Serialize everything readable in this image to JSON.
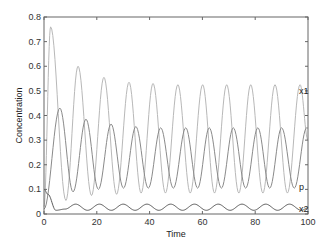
{
  "chart_data": {
    "type": "line",
    "title": "",
    "xlabel": "Time",
    "ylabel": "Concentration",
    "xlim": [
      0,
      100
    ],
    "ylim": [
      0,
      0.8
    ],
    "xticks": [
      0,
      20,
      40,
      60,
      80,
      100
    ],
    "yticks": [
      0,
      0.1,
      0.2,
      0.3,
      0.4,
      0.5,
      0.6,
      0.7,
      0.8
    ],
    "ytick_labels": [
      "0",
      "0.1",
      "0.2",
      "0.3",
      "0.4",
      "0.5",
      "0.6",
      "0.7",
      "0.8"
    ],
    "grid": false,
    "legend": "inline labels at right end of each series",
    "series": [
      {
        "name": "x1",
        "color": "#b8b8b8",
        "label_value": 0.5,
        "keypoints": [
          [
            0,
            0.03
          ],
          [
            2.5,
            0.76
          ],
          [
            8.3,
            0.055
          ],
          [
            12.9,
            0.6
          ],
          [
            18.0,
            0.075
          ],
          [
            22.7,
            0.555
          ],
          [
            27.5,
            0.08
          ],
          [
            32.2,
            0.535
          ],
          [
            36.8,
            0.085
          ],
          [
            41.3,
            0.53
          ],
          [
            46.0,
            0.085
          ],
          [
            50.7,
            0.525
          ],
          [
            55.4,
            0.085
          ],
          [
            60.1,
            0.525
          ],
          [
            64.6,
            0.085
          ],
          [
            69.2,
            0.525
          ],
          [
            73.8,
            0.085
          ],
          [
            78.3,
            0.525
          ],
          [
            82.9,
            0.085
          ],
          [
            87.5,
            0.525
          ],
          [
            92.2,
            0.085
          ],
          [
            97.0,
            0.525
          ],
          [
            100,
            0.3
          ]
        ]
      },
      {
        "name": "p",
        "color": "#8a8a8a",
        "label_value": 0.11,
        "keypoints": [
          [
            0,
            0.02
          ],
          [
            6.0,
            0.43
          ],
          [
            11.0,
            0.09
          ],
          [
            15.9,
            0.385
          ],
          [
            20.6,
            0.1
          ],
          [
            25.4,
            0.365
          ],
          [
            30.1,
            0.105
          ],
          [
            34.8,
            0.355
          ],
          [
            39.5,
            0.105
          ],
          [
            44.2,
            0.35
          ],
          [
            49.0,
            0.105
          ],
          [
            53.7,
            0.35
          ],
          [
            58.2,
            0.105
          ],
          [
            62.6,
            0.35
          ],
          [
            67.2,
            0.105
          ],
          [
            71.7,
            0.35
          ],
          [
            76.4,
            0.105
          ],
          [
            81.0,
            0.35
          ],
          [
            85.5,
            0.105
          ],
          [
            90.0,
            0.35
          ],
          [
            94.8,
            0.105
          ],
          [
            99.5,
            0.35
          ],
          [
            100,
            0.349
          ]
        ]
      },
      {
        "name": "x2",
        "color": "#5a5a5a",
        "label_value": 0.02,
        "keypoints": [
          [
            0,
            0.1
          ],
          [
            1.5,
            0.08
          ],
          [
            4.5,
            0.015
          ],
          [
            8.0,
            0.02
          ],
          [
            12.0,
            0.04
          ],
          [
            16.5,
            0.015
          ],
          [
            21.0,
            0.04
          ],
          [
            25.5,
            0.015
          ],
          [
            30.0,
            0.04
          ],
          [
            34.5,
            0.015
          ],
          [
            39.0,
            0.04
          ],
          [
            43.5,
            0.015
          ],
          [
            48.0,
            0.04
          ],
          [
            52.5,
            0.015
          ],
          [
            57.0,
            0.04
          ],
          [
            61.5,
            0.015
          ],
          [
            66.0,
            0.04
          ],
          [
            70.5,
            0.015
          ],
          [
            75.0,
            0.04
          ],
          [
            79.5,
            0.015
          ],
          [
            84.0,
            0.04
          ],
          [
            88.5,
            0.015
          ],
          [
            93.0,
            0.04
          ],
          [
            97.5,
            0.015
          ],
          [
            100,
            0.025
          ]
        ]
      }
    ]
  },
  "layout": {
    "plot_left": 44,
    "plot_right": 308,
    "plot_top": 17,
    "plot_bottom": 214,
    "axis_color": "#666666"
  }
}
